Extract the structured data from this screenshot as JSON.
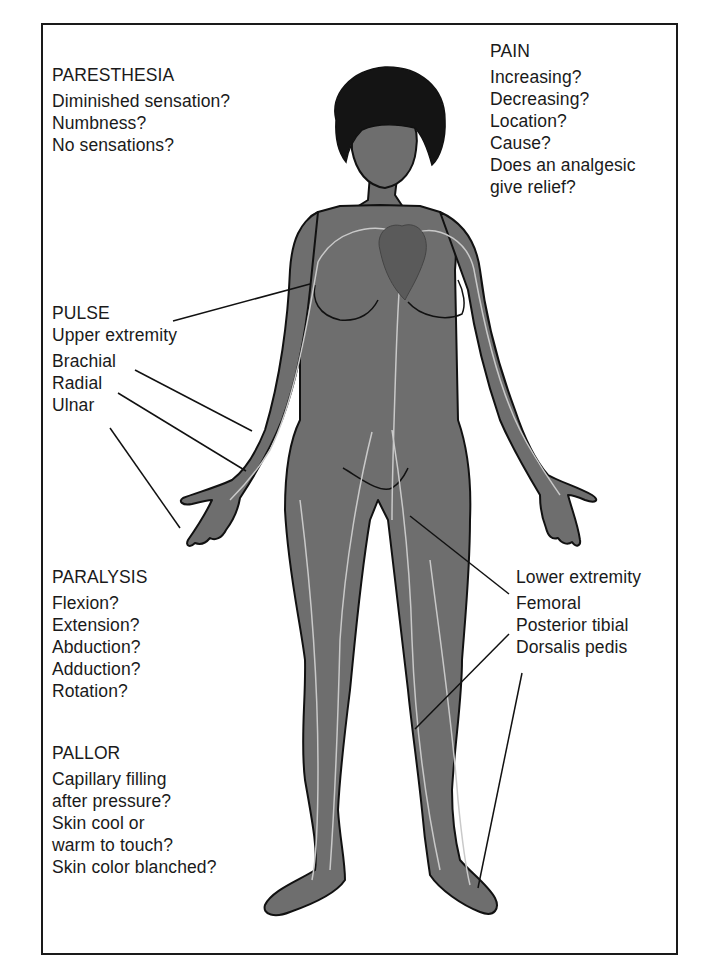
{
  "figure": {
    "skin_color": "#6e6e6e",
    "outline_color": "#111111",
    "vessel_color": "#c9c9c9",
    "hair_color": "#141414"
  },
  "paresthesia": {
    "title": "PARESTHESIA",
    "items": [
      "Diminished sensation?",
      "Numbness?",
      "No sensations?"
    ]
  },
  "pain": {
    "title": "PAIN",
    "items": [
      "Increasing?",
      "Decreasing?",
      "Location?",
      "Cause?",
      "Does an analgesic",
      "give relief?"
    ]
  },
  "pulse": {
    "title": "PULSE",
    "subtitle": "Upper extremity",
    "items": [
      "Brachial",
      "Radial",
      "Ulnar"
    ]
  },
  "lower": {
    "subtitle": "Lower extremity",
    "items": [
      "Femoral",
      "Posterior tibial",
      "Dorsalis pedis"
    ]
  },
  "paralysis": {
    "title": "PARALYSIS",
    "items": [
      "Flexion?",
      "Extension?",
      "Abduction?",
      "Adduction?",
      "Rotation?"
    ]
  },
  "pallor": {
    "title": "PALLOR",
    "items": [
      "Capillary filling",
      "after pressure?",
      "Skin cool or",
      "warm to touch?",
      "Skin color blanched?"
    ]
  }
}
